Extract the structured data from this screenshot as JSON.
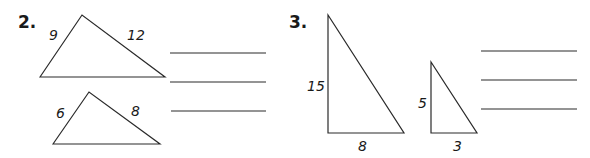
{
  "problems": [
    {
      "number": "2.",
      "triangles": [
        {
          "labels": [
            "9",
            "12"
          ]
        },
        {
          "labels": [
            "6",
            "8"
          ]
        }
      ],
      "answer_lines": 3
    },
    {
      "number": "3.",
      "triangles": [
        {
          "labels": [
            "15",
            "8"
          ]
        },
        {
          "labels": [
            "5",
            "3"
          ]
        }
      ],
      "answer_lines": 3
    }
  ]
}
